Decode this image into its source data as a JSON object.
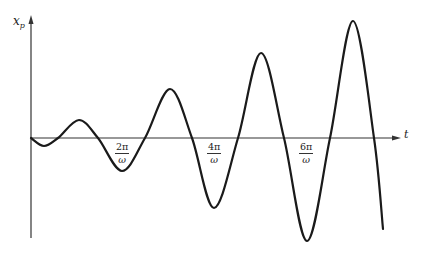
{
  "chart_data": {
    "type": "line",
    "title": "",
    "xlabel": "t",
    "ylabel": "x_p",
    "ylabel_main": "x",
    "ylabel_sub": "p",
    "grid": false,
    "legend": null,
    "x_ticks": [
      {
        "label_num": "2π",
        "label_den": "ω",
        "value": "2π/ω"
      },
      {
        "label_num": "4π",
        "label_den": "ω",
        "value": "4π/ω"
      },
      {
        "label_num": "6π",
        "label_den": "ω",
        "value": "6π/ω"
      }
    ],
    "series": [
      {
        "name": "x_p(t)",
        "points_px": [
          [
            31,
            138
          ],
          [
            44,
            146
          ],
          [
            58,
            138
          ],
          [
            79,
            120
          ],
          [
            98,
            138
          ],
          [
            122,
            171
          ],
          [
            145,
            138
          ],
          [
            170,
            89
          ],
          [
            192,
            138
          ],
          [
            214,
            208
          ],
          [
            238,
            138
          ],
          [
            261,
            53
          ],
          [
            284,
            138
          ],
          [
            307,
            241
          ],
          [
            330,
            138
          ],
          [
            353,
            21
          ],
          [
            374,
            138
          ],
          [
            383,
            229
          ]
        ],
        "extrema": [
          {
            "kind": "min",
            "approx_amplitude": -0.3
          },
          {
            "kind": "max",
            "approx_amplitude": 0.6
          },
          {
            "kind": "min",
            "approx_amplitude": -1.0
          },
          {
            "kind": "max",
            "approx_amplitude": 1.5
          },
          {
            "kind": "min",
            "approx_amplitude": -2.2
          },
          {
            "kind": "max",
            "approx_amplitude": 2.8
          },
          {
            "kind": "min",
            "approx_amplitude": -3.2
          },
          {
            "kind": "max",
            "approx_amplitude": 3.9
          }
        ]
      }
    ],
    "axes": {
      "origin_px": [
        31,
        138
      ],
      "y_axis_px": {
        "x": 31,
        "top": 17,
        "bottom": 238
      },
      "x_axis_px": {
        "y": 138,
        "left": 31,
        "right": 399
      }
    }
  },
  "labels": {
    "y_main": "x",
    "y_sub": "p",
    "x_axis": "t",
    "ticks": [
      {
        "num": "2π",
        "den": "ω"
      },
      {
        "num": "4π",
        "den": "ω"
      },
      {
        "num": "6π",
        "den": "ω"
      }
    ]
  }
}
